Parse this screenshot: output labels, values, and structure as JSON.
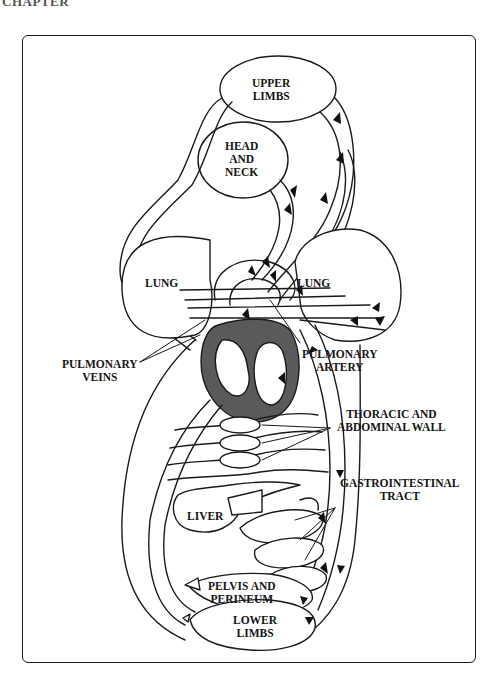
{
  "page": {
    "header_fragment": "CHAPTER",
    "footer_fragment": "..."
  },
  "diagram": {
    "title": "",
    "type": "systemic and pulmonary circulation schematic",
    "organ_labels": {
      "upper_limbs": [
        "UPPER",
        "LIMBS"
      ],
      "head_and_neck": [
        "HEAD",
        "AND",
        "NECK"
      ],
      "lung_left": "LUNG",
      "lung_right": "LUNG",
      "liver": "LIVER",
      "pelvis_and_perineum": [
        "PELVIS AND",
        "PERINEUM"
      ],
      "lower_limbs": [
        "LOWER",
        "LIMBS"
      ]
    },
    "callouts": {
      "pulmonary_veins": [
        "PULMONARY",
        "VEINS"
      ],
      "pulmonary_artery": [
        "PULMONARY",
        "ARTERY"
      ],
      "thoracic_abdominal_wall": [
        "THORACIC AND",
        "ABDOMINAL WALL"
      ],
      "gastrointestinal_tract": [
        "GASTROINTESTINAL",
        "TRACT"
      ]
    },
    "colors": {
      "stroke": "#1a1a1a",
      "heart_wall": "#5a5a5a",
      "background": "#ffffff"
    }
  }
}
